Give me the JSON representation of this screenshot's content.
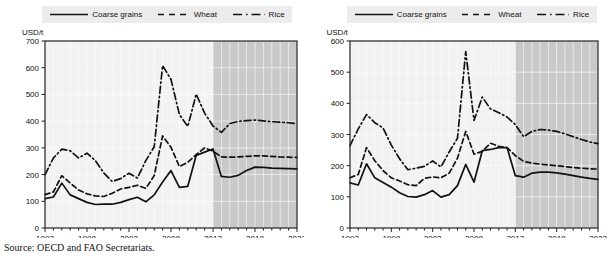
{
  "figure": {
    "source_note": "Source:  OECD and FAO Secretariats.",
    "background": "#ffffff",
    "legend_background": "#ececec",
    "plot_background": "#f2f2f2",
    "projection_background": "#c9c9c9",
    "line_color": "#111111"
  },
  "legend": {
    "entries": [
      {
        "label": "Coarse grains",
        "key": "solid-line-key",
        "dash": "none"
      },
      {
        "label": "Wheat",
        "key": "dashed-line-key",
        "dash": "dashed"
      },
      {
        "label": "Rice",
        "key": "dash-dot-line-key",
        "dash": "dash-dot"
      }
    ]
  },
  "chart_data": [
    {
      "id": "left-panel",
      "type": "line",
      "title": "",
      "xlabel": "",
      "ylabel": "USD/t",
      "unit": "USD/t",
      "xlim": [
        1993,
        2023
      ],
      "ylim": [
        0,
        700
      ],
      "yticks": [
        0,
        100,
        200,
        300,
        400,
        500,
        600,
        700
      ],
      "xticks": [
        1993,
        1998,
        2003,
        2008,
        2013,
        2018,
        2023
      ],
      "grid": true,
      "legend_position": "top",
      "projection_start": 2013,
      "projection_label": "shaded area = projection period",
      "x": [
        1993,
        1994,
        1995,
        1996,
        1997,
        1998,
        1999,
        2000,
        2001,
        2002,
        2003,
        2004,
        2005,
        2006,
        2007,
        2008,
        2009,
        2010,
        2011,
        2012,
        2013,
        2014,
        2015,
        2016,
        2017,
        2018,
        2019,
        2020,
        2021,
        2022,
        2023
      ],
      "series": [
        {
          "name": "Coarse grains",
          "dash": "none",
          "values": [
            110,
            116,
            168,
            124,
            110,
            96,
            88,
            89,
            89,
            96,
            106,
            115,
            98,
            124,
            172,
            215,
            152,
            156,
            272,
            284,
            296,
            193,
            190,
            197,
            215,
            228,
            227,
            224,
            223,
            222,
            221
          ]
        },
        {
          "name": "Wheat",
          "dash": "dashed",
          "values": [
            125,
            135,
            196,
            168,
            142,
            128,
            120,
            118,
            130,
            146,
            152,
            160,
            148,
            196,
            345,
            302,
            230,
            246,
            275,
            300,
            288,
            266,
            265,
            266,
            268,
            270,
            270,
            268,
            266,
            265,
            264
          ]
        },
        {
          "name": "Rice",
          "dash": "dash-dot",
          "values": [
            200,
            262,
            295,
            289,
            262,
            280,
            252,
            206,
            174,
            185,
            205,
            187,
            252,
            304,
            608,
            556,
            425,
            380,
            501,
            430,
            382,
            358,
            391,
            399,
            402,
            404,
            401,
            398,
            396,
            394,
            391
          ]
        }
      ]
    },
    {
      "id": "right-panel",
      "type": "line",
      "title": "",
      "xlabel": "",
      "ylabel": "USD/t",
      "unit": "USD/t",
      "xlim": [
        1993,
        2023
      ],
      "ylim": [
        0,
        600
      ],
      "yticks": [
        0,
        100,
        200,
        300,
        400,
        500,
        600
      ],
      "xticks": [
        1993,
        1998,
        2003,
        2008,
        2013,
        2018,
        2023
      ],
      "grid": true,
      "legend_position": "top",
      "projection_start": 2013,
      "projection_label": "shaded area = projection period",
      "x": [
        1993,
        1994,
        1995,
        1996,
        1997,
        1998,
        1999,
        2000,
        2001,
        2002,
        2003,
        2004,
        2005,
        2006,
        2007,
        2008,
        2009,
        2010,
        2011,
        2012,
        2013,
        2014,
        2015,
        2016,
        2017,
        2018,
        2019,
        2020,
        2021,
        2022,
        2023
      ],
      "series": [
        {
          "name": "Coarse grains",
          "dash": "none",
          "values": [
            145,
            138,
            206,
            161,
            146,
            131,
            113,
            101,
            99,
            107,
            120,
            99,
            107,
            136,
            204,
            147,
            248,
            252,
            258,
            258,
            168,
            163,
            176,
            179,
            179,
            177,
            173,
            168,
            163,
            159,
            156
          ]
        },
        {
          "name": "Wheat",
          "dash": "dashed",
          "values": [
            161,
            172,
            258,
            216,
            184,
            161,
            151,
            139,
            136,
            159,
            164,
            161,
            176,
            224,
            310,
            237,
            246,
            272,
            262,
            258,
            232,
            214,
            208,
            205,
            202,
            200,
            197,
            194,
            192,
            190,
            189
          ]
        },
        {
          "name": "Rice",
          "dash": "dash-dot",
          "values": [
            264,
            318,
            364,
            338,
            321,
            266,
            222,
            187,
            192,
            198,
            215,
            196,
            244,
            288,
            566,
            345,
            420,
            382,
            370,
            356,
            332,
            293,
            310,
            316,
            314,
            310,
            302,
            293,
            284,
            276,
            271
          ]
        }
      ]
    }
  ]
}
